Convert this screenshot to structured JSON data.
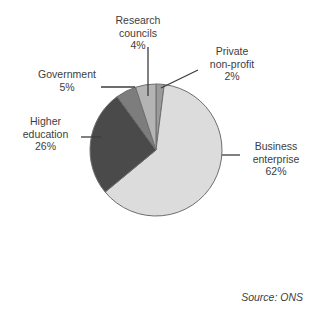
{
  "chart_data": {
    "type": "pie",
    "title": "",
    "subtitle": "",
    "xlabel": "",
    "ylabel": "",
    "legend_position": "none",
    "grid": false,
    "units": "percent",
    "source_note": "Source: ONS",
    "categories": [
      "Private non-profit",
      "Business enterprise",
      "Higher education",
      "Government",
      "Research councils"
    ],
    "values": [
      2,
      62,
      26,
      5,
      4
    ],
    "slices": [
      {
        "name": "private-non-profit",
        "label_lines": [
          "Private",
          "non-profit",
          "2%"
        ],
        "value": 2,
        "value_label": "2%",
        "color": "#9a9a9a",
        "start_angle": 0,
        "end_angle": 7.2
      },
      {
        "name": "business-enterprise",
        "label_lines": [
          "Business",
          "enterprise",
          "62%"
        ],
        "value": 62,
        "value_label": "62%",
        "color": "#dcdcdc",
        "start_angle": 7.2,
        "end_angle": 230.4
      },
      {
        "name": "higher-education",
        "label_lines": [
          "Higher",
          "education",
          "26%"
        ],
        "value": 26,
        "value_label": "26%",
        "color": "#4a4a4a",
        "start_angle": 230.4,
        "end_angle": 324.0
      },
      {
        "name": "government",
        "label_lines": [
          "Government",
          "5%"
        ],
        "value": 5,
        "value_label": "5%",
        "color": "#7d7d7d",
        "start_angle": 324.0,
        "end_angle": 342.0
      },
      {
        "name": "research-councils",
        "label_lines": [
          "Research",
          "councils",
          "4%"
        ],
        "value": 4,
        "value_label": "4%",
        "color": "#b4b4b4",
        "start_angle": 342.0,
        "end_angle": 360.0
      }
    ],
    "colors": {
      "private_non_profit": "#9a9a9a",
      "business_enterprise": "#dcdcdc",
      "higher_education": "#4a4a4a",
      "government": "#7d7d7d",
      "research_councils": "#b4b4b4",
      "outline": "#6e6e6e",
      "leader_line": "#3d3d3d",
      "background": "#ffffff",
      "text": "#3d3d3d"
    }
  },
  "labels": {
    "research_councils": {
      "line1": "Research",
      "line2": "councils",
      "line3": "4%"
    },
    "private_non_profit": {
      "line1": "Private",
      "line2": "non-profit",
      "line3": "2%"
    },
    "government": {
      "line1": "Government",
      "line2": "5%"
    },
    "higher_education": {
      "line1": "Higher",
      "line2": "education",
      "line3": "26%"
    },
    "business_enterprise": {
      "line1": "Business",
      "line2": "enterprise",
      "line3": "62%"
    }
  },
  "footer": {
    "source": "Source: ONS"
  }
}
